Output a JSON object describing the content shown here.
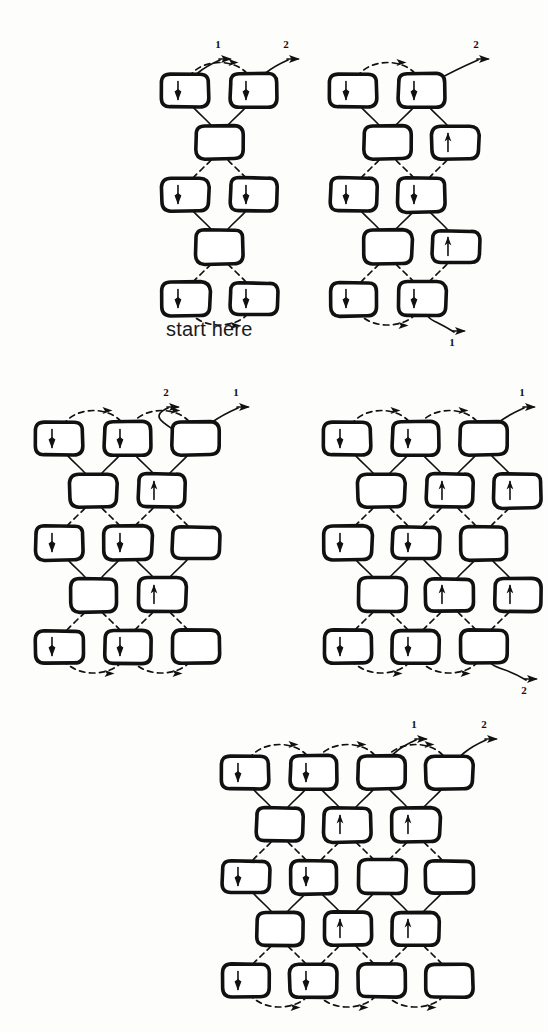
{
  "figure": {
    "background_color": "#fdfdfc",
    "ink_color": "#111111",
    "width": 548,
    "height": 1032,
    "annotation": {
      "start_here_label": "start here",
      "strand_label_1": "1",
      "strand_label_2": "2"
    }
  },
  "legend": {
    "solid_path_meaning": "solid curved strand",
    "dashed_path_meaning": "dashed curved strand",
    "box_meaning": "rounded-rectangle element"
  },
  "diagrams": [
    {
      "id": "diagram-1",
      "caption": "start here",
      "origin": {
        "x": 148,
        "y": 60
      },
      "box_size": {
        "w": 47,
        "h": 33
      },
      "pitch": {
        "x": 68,
        "y": 52
      },
      "rows": [
        {
          "row": 0,
          "cols": [
            0,
            1
          ]
        },
        {
          "row": 1,
          "cols": [
            0.5
          ]
        },
        {
          "row": 2,
          "cols": [
            0,
            1
          ]
        },
        {
          "row": 3,
          "cols": [
            0.5
          ]
        },
        {
          "row": 4,
          "cols": [
            0,
            1
          ]
        }
      ],
      "labels": [
        {
          "text": "1",
          "x": 56,
          "y": -26
        },
        {
          "text": "2",
          "x": 124,
          "y": -26
        }
      ],
      "caption_pos": {
        "x": 18,
        "y": 258
      }
    },
    {
      "id": "diagram-2",
      "caption": "",
      "origin": {
        "x": 316,
        "y": 60
      },
      "box_size": {
        "w": 47,
        "h": 33
      },
      "pitch": {
        "x": 68,
        "y": 52
      },
      "rows": [
        {
          "row": 0,
          "cols": [
            0,
            1
          ]
        },
        {
          "row": 1,
          "cols": [
            0.5,
            1.5
          ]
        },
        {
          "row": 2,
          "cols": [
            0,
            1
          ]
        },
        {
          "row": 3,
          "cols": [
            0.5,
            1.5
          ]
        },
        {
          "row": 4,
          "cols": [
            0,
            1
          ]
        }
      ],
      "labels": [
        {
          "text": "2",
          "x": 146,
          "y": -26
        },
        {
          "text": "1",
          "x": 122,
          "y": 272
        }
      ],
      "caption_pos": null
    },
    {
      "id": "diagram-3",
      "caption": "",
      "origin": {
        "x": 22,
        "y": 408
      },
      "box_size": {
        "w": 47,
        "h": 33
      },
      "pitch": {
        "x": 68,
        "y": 52
      },
      "rows": [
        {
          "row": 0,
          "cols": [
            0,
            1,
            2
          ]
        },
        {
          "row": 1,
          "cols": [
            0.5,
            1.5
          ]
        },
        {
          "row": 2,
          "cols": [
            0,
            1,
            2
          ]
        },
        {
          "row": 3,
          "cols": [
            0.5,
            1.5
          ]
        },
        {
          "row": 4,
          "cols": [
            0,
            1,
            2
          ]
        }
      ],
      "labels": [
        {
          "text": "2",
          "x": 130,
          "y": -26
        },
        {
          "text": "1",
          "x": 200,
          "y": -26
        }
      ],
      "caption_pos": null
    },
    {
      "id": "diagram-4",
      "caption": "",
      "origin": {
        "x": 310,
        "y": 408
      },
      "box_size": {
        "w": 47,
        "h": 33
      },
      "pitch": {
        "x": 68,
        "y": 52
      },
      "rows": [
        {
          "row": 0,
          "cols": [
            0,
            1,
            2
          ]
        },
        {
          "row": 1,
          "cols": [
            0.5,
            1.5,
            2.5
          ]
        },
        {
          "row": 2,
          "cols": [
            0,
            1,
            2
          ]
        },
        {
          "row": 3,
          "cols": [
            0.5,
            1.5,
            2.5
          ]
        },
        {
          "row": 4,
          "cols": [
            0,
            1,
            2
          ]
        }
      ],
      "labels": [
        {
          "text": "1",
          "x": 198,
          "y": -26
        },
        {
          "text": "2",
          "x": 200,
          "y": 272
        }
      ],
      "caption_pos": null
    },
    {
      "id": "diagram-5",
      "caption": "",
      "origin": {
        "x": 208,
        "y": 742
      },
      "box_size": {
        "w": 47,
        "h": 33
      },
      "pitch": {
        "x": 68,
        "y": 52
      },
      "rows": [
        {
          "row": 0,
          "cols": [
            0,
            1,
            2,
            3
          ]
        },
        {
          "row": 1,
          "cols": [
            0.5,
            1.5,
            2.5
          ]
        },
        {
          "row": 2,
          "cols": [
            0,
            1,
            2,
            3
          ]
        },
        {
          "row": 3,
          "cols": [
            0.5,
            1.5,
            2.5
          ]
        },
        {
          "row": 4,
          "cols": [
            0,
            1,
            2,
            3
          ]
        }
      ],
      "labels": [
        {
          "text": "1",
          "x": 192,
          "y": -28
        },
        {
          "text": "2",
          "x": 262,
          "y": -28
        }
      ],
      "caption_pos": null
    }
  ]
}
